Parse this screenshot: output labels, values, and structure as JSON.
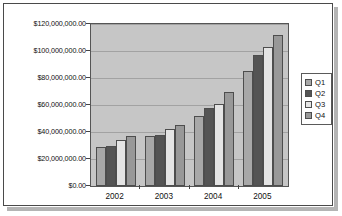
{
  "chart_data": {
    "type": "bar",
    "title": "",
    "xlabel": "",
    "ylabel": "",
    "categories": [
      "2002",
      "2003",
      "2004",
      "2005"
    ],
    "series": [
      {
        "name": "Q1",
        "color": "#a8a8a8",
        "values": [
          29000000,
          37000000,
          52000000,
          85000000
        ]
      },
      {
        "name": "Q2",
        "color": "#545454",
        "values": [
          30000000,
          37500000,
          58000000,
          97000000
        ]
      },
      {
        "name": "Q3",
        "color": "#e4e4e4",
        "values": [
          34000000,
          42000000,
          61000000,
          103000000
        ]
      },
      {
        "name": "Q4",
        "color": "#989898",
        "values": [
          37000000,
          45000000,
          70000000,
          112000000
        ]
      }
    ],
    "ylim": [
      0,
      120000000
    ],
    "y_ticks": [
      0,
      20000000,
      40000000,
      60000000,
      80000000,
      100000000,
      120000000
    ],
    "y_tick_labels": [
      "$0.00",
      "$20,000,000.00",
      "$40,000,000.00",
      "$60,000,000.00",
      "$80,000,000.00",
      "$100,000,000.00",
      "$120,000,000.00"
    ],
    "grid": true,
    "legend_position": "right",
    "plot_background": "#c6c6c6",
    "gridline_color": "#a2a2a2",
    "frame_border_color": "#4a4a4a",
    "shadow_color": "#b4b4b4"
  },
  "legend": {
    "entries": [
      {
        "label": "Q1"
      },
      {
        "label": "Q2"
      },
      {
        "label": "Q3"
      },
      {
        "label": "Q4"
      }
    ]
  }
}
